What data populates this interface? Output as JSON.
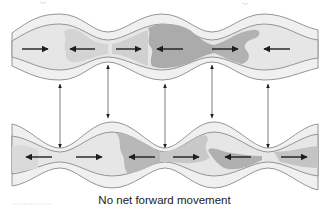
{
  "diagram": {
    "caption": "No net forward movement",
    "colors": {
      "outer_wall": "#f0f0f0",
      "inner_wall": "#e2e2e2",
      "lumen_light": "#e9e9e9",
      "chyme_medium": "#cfcfcf",
      "chyme_dark": "#a9a9a9",
      "outline": "#8a8a8a",
      "arrow": "#1e1e1e",
      "vertical_arrow": "#6e6e6e"
    },
    "top_tube": {
      "state": "first segmentation contraction",
      "constriction_x": [
        108,
        212
      ],
      "bulge_x": [
        60,
        165,
        265
      ],
      "horizontal_arrows": [
        {
          "x1": 22,
          "x2": 48,
          "direction": "right"
        },
        {
          "x1": 95,
          "x2": 70,
          "direction": "left"
        },
        {
          "x1": 116,
          "x2": 141,
          "direction": "right"
        },
        {
          "x1": 183,
          "x2": 157,
          "direction": "left"
        },
        {
          "x1": 212,
          "x2": 238,
          "direction": "right"
        },
        {
          "x1": 290,
          "x2": 264,
          "direction": "left"
        }
      ]
    },
    "bottom_tube": {
      "state": "second segmentation contraction",
      "constriction_x": [
        60,
        165,
        268
      ],
      "bulge_x": [
        112,
        213
      ],
      "horizontal_arrows": [
        {
          "x1": 52,
          "x2": 26,
          "direction": "left"
        },
        {
          "x1": 76,
          "x2": 102,
          "direction": "right"
        },
        {
          "x1": 155,
          "x2": 129,
          "direction": "left"
        },
        {
          "x1": 173,
          "x2": 199,
          "direction": "right"
        },
        {
          "x1": 251,
          "x2": 225,
          "direction": "left"
        },
        {
          "x1": 281,
          "x2": 307,
          "direction": "right"
        }
      ]
    },
    "vertical_arrows": [
      {
        "x": 60,
        "label": "alternating-contraction-link-1"
      },
      {
        "x": 108,
        "label": "alternating-contraction-link-2"
      },
      {
        "x": 165,
        "label": "alternating-contraction-link-3"
      },
      {
        "x": 212,
        "label": "alternating-contraction-link-4"
      },
      {
        "x": 268,
        "label": "alternating-contraction-link-5"
      }
    ]
  }
}
